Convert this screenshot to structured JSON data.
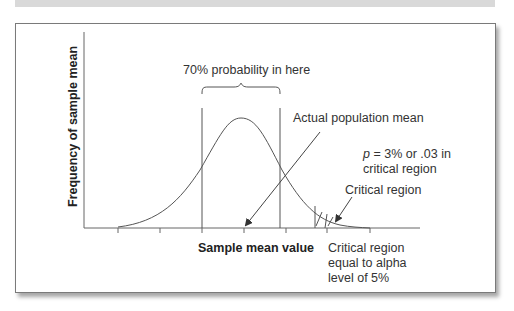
{
  "figure": {
    "y_axis_label": "Frequency of sample mean",
    "x_axis_label": "Sample mean value",
    "annotations": {
      "probability_region": "70% probability in here",
      "population_mean": "Actual population mean",
      "p_value_line1_var": "p",
      "p_value_line1_rest": " = 3% or .03 in",
      "p_value_line2": "critical region",
      "critical_region": "Critical region",
      "alpha_line1": "Critical region",
      "alpha_line2": "equal to alpha",
      "alpha_line3": "level of 5%"
    },
    "colors": {
      "line": "#555555",
      "text": "#333333",
      "frame": "#7a7a7a",
      "top_bar": "#d9d9d9"
    }
  }
}
